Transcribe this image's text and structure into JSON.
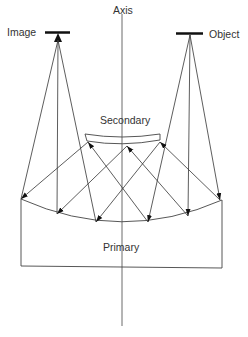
{
  "diagram": {
    "labels": {
      "axis": "Axis",
      "image": "Image",
      "object": "Object",
      "secondary": "Secondary",
      "primary": "Primary"
    },
    "colors": {
      "line": "#333333",
      "bar": "#111111",
      "background": "#ffffff"
    }
  }
}
